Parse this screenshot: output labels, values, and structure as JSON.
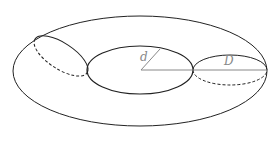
{
  "diagram": {
    "labels": {
      "inner_radius": "d",
      "tube_diameter": "D"
    },
    "colors": {
      "stroke": "#222222",
      "measure_line": "#888888",
      "background": "#ffffff"
    },
    "shapes": {
      "outer_ellipse": {
        "cx": 140,
        "cy": 71,
        "rx": 127,
        "ry": 55
      },
      "inner_ellipse": {
        "cx": 140,
        "cy": 70,
        "rx": 53,
        "ry": 24
      },
      "right_section": {
        "cx": 230,
        "cy": 70,
        "rx": 37,
        "ry": 15
      },
      "left_section": {
        "cx": 60,
        "cy": 56,
        "rx": 31,
        "ry": 13,
        "rotate": 33
      }
    }
  }
}
